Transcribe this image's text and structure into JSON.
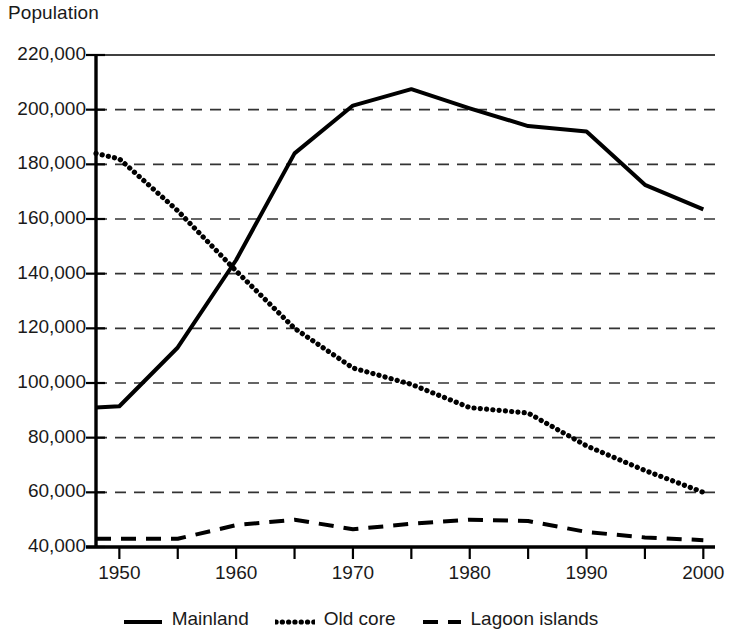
{
  "chart_data": {
    "type": "line",
    "title": "",
    "ylabel": "Population",
    "xlabel": "",
    "ylim": [
      40000,
      220000
    ],
    "xlim": [
      1948,
      2001
    ],
    "grid": "horizontal-dashed",
    "legend_position": "bottom",
    "yticks": [
      "220,000",
      "200,000",
      "180,000",
      "160,000",
      "140,000",
      "120,000",
      "100,000",
      "80,000",
      "60,000",
      "40,000"
    ],
    "ytick_values": [
      220000,
      200000,
      180000,
      160000,
      140000,
      120000,
      100000,
      80000,
      60000,
      40000
    ],
    "xticks": [
      "1950",
      "1960",
      "1970",
      "1980",
      "1990",
      "2000"
    ],
    "xtick_values": [
      1950,
      1960,
      1970,
      1980,
      1990,
      2000
    ],
    "xminor_values": [
      1955,
      1965,
      1975,
      1985,
      1995
    ],
    "series": [
      {
        "name": "Mainland",
        "style": "solid",
        "color": "#000000",
        "x": [
          1948,
          1950,
          1955,
          1960,
          1965,
          1970,
          1975,
          1980,
          1985,
          1990,
          1995,
          2000
        ],
        "values": [
          91000,
          91500,
          113000,
          145000,
          184000,
          201500,
          207500,
          200500,
          194000,
          192000,
          172500,
          163500
        ]
      },
      {
        "name": "Old core",
        "style": "dotted",
        "color": "#000000",
        "x": [
          1948,
          1950,
          1955,
          1960,
          1965,
          1970,
          1975,
          1980,
          1985,
          1990,
          1995,
          2000
        ],
        "values": [
          184000,
          182000,
          163000,
          141000,
          120000,
          105500,
          99500,
          91000,
          89000,
          77000,
          68000,
          60000
        ]
      },
      {
        "name": "Lagoon islands",
        "style": "dashed",
        "color": "#000000",
        "x": [
          1948,
          1950,
          1955,
          1960,
          1965,
          1970,
          1975,
          1980,
          1985,
          1990,
          1995,
          2000
        ],
        "values": [
          43000,
          43000,
          43000,
          48000,
          50000,
          46500,
          48500,
          50000,
          49500,
          45500,
          43500,
          42500
        ]
      }
    ]
  },
  "legend": {
    "items": [
      {
        "label": "Mainland",
        "style": "solid"
      },
      {
        "label": "Old core",
        "style": "dotted"
      },
      {
        "label": "Lagoon islands",
        "style": "dashed"
      }
    ]
  }
}
